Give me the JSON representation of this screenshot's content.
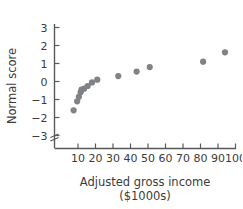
{
  "chart_data": {
    "type": "scatter",
    "title": "",
    "xlabel": "Adjusted gross income",
    "xlabel_line2": "($1000s)",
    "ylabel": "Normal score",
    "xlim": [
      0,
      105
    ],
    "ylim": [
      -3.6,
      3.4
    ],
    "grid": false,
    "legend": false,
    "axis_break": "y-axis break below -3",
    "point_color": "#808285",
    "axis_color": "#59595b",
    "x_ticks": [
      10,
      20,
      30,
      40,
      50,
      60,
      70,
      80,
      90,
      100
    ],
    "x_tick_labels": [
      "10",
      "20",
      "30",
      "40",
      "50",
      "60",
      "70",
      "80",
      "90",
      "100"
    ],
    "y_ticks": [
      -3,
      -2,
      -1,
      0,
      1,
      2,
      3
    ],
    "y_tick_labels": [
      "−3",
      "−2",
      "−1",
      "0",
      "1",
      "2",
      "3"
    ],
    "x": [
      7.5,
      9.5,
      10.5,
      11.5,
      12.0,
      13.5,
      15.5,
      18.0,
      21.0,
      33.0,
      43.5,
      51.0,
      81.5,
      94.0
    ],
    "y": [
      -1.6,
      -1.1,
      -0.85,
      -0.6,
      -0.45,
      -0.4,
      -0.25,
      -0.05,
      0.1,
      0.3,
      0.55,
      0.8,
      1.1,
      1.62
    ],
    "points": [
      {
        "x": 7.5,
        "y": -1.6
      },
      {
        "x": 9.5,
        "y": -1.1
      },
      {
        "x": 10.5,
        "y": -0.85
      },
      {
        "x": 11.5,
        "y": -0.6
      },
      {
        "x": 12.0,
        "y": -0.45
      },
      {
        "x": 13.5,
        "y": -0.4
      },
      {
        "x": 15.5,
        "y": -0.25
      },
      {
        "x": 18.0,
        "y": -0.05
      },
      {
        "x": 21.0,
        "y": 0.1
      },
      {
        "x": 33.0,
        "y": 0.3
      },
      {
        "x": 43.5,
        "y": 0.55
      },
      {
        "x": 51.0,
        "y": 0.8
      },
      {
        "x": 81.5,
        "y": 1.1
      },
      {
        "x": 94.0,
        "y": 1.62
      }
    ]
  },
  "axes": {
    "x_title": "Adjusted gross income",
    "x_subtitle": "($1000s)",
    "y_title": "Normal score"
  }
}
